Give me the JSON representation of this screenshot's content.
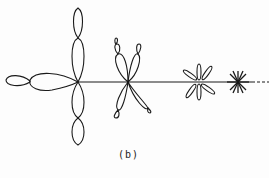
{
  "figure": {
    "caption": "(b)",
    "stroke_color": "#1a1a1a",
    "patterns": [
      {
        "name": "large-lobe-pattern",
        "center": [
          78,
          82
        ]
      },
      {
        "name": "medium-x-lobe-pattern",
        "center": [
          128,
          82
        ]
      },
      {
        "name": "small-star-lobe-pattern",
        "center": [
          199,
          82
        ]
      },
      {
        "name": "tiny-star-pattern",
        "center": [
          238,
          82
        ]
      }
    ]
  }
}
